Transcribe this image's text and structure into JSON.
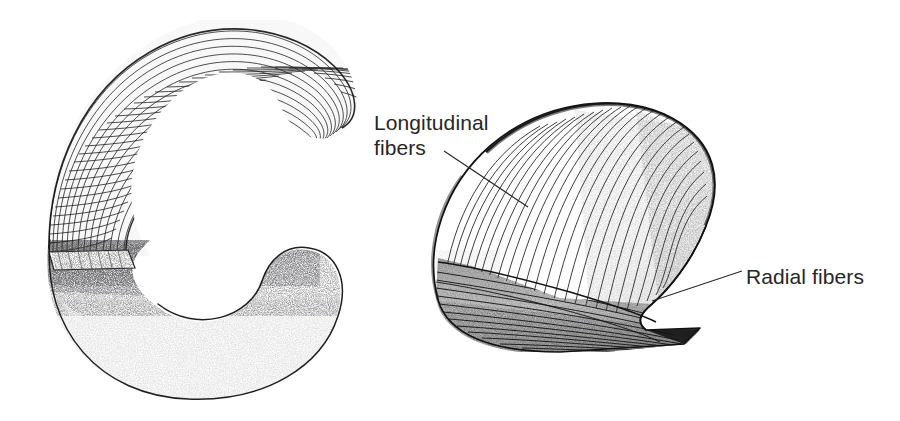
{
  "figure": {
    "kind": "anatomical-line-illustration",
    "background_color": "#ffffff",
    "ink_color": "#1a1a1a",
    "text_color": "#262626",
    "panels": [
      {
        "name": "left-panel",
        "description": "C-shaped crescent body, upper half rendered as a cross-hatched quadrilateral mesh, lower half rendered as smooth stippled shading"
      },
      {
        "name": "right-panel",
        "description": "Hook / claw shaped body cut away to expose internal fiber layers, upper region with longitudinal fibers, lower region with radial fibers"
      }
    ]
  },
  "labels": {
    "longitudinal": {
      "text": "Longitudinal\nfibers",
      "line1": "Longitudinal",
      "line2": "fibers"
    },
    "radial": {
      "text": "Radial fibers"
    }
  },
  "leaders": [
    {
      "name": "longitudinal-leader",
      "from_x": 444,
      "from_y": 151,
      "to_x": 528,
      "to_y": 207
    },
    {
      "name": "radial-leader",
      "from_x": 742,
      "from_y": 271,
      "to_x": 652,
      "to_y": 301
    }
  ]
}
